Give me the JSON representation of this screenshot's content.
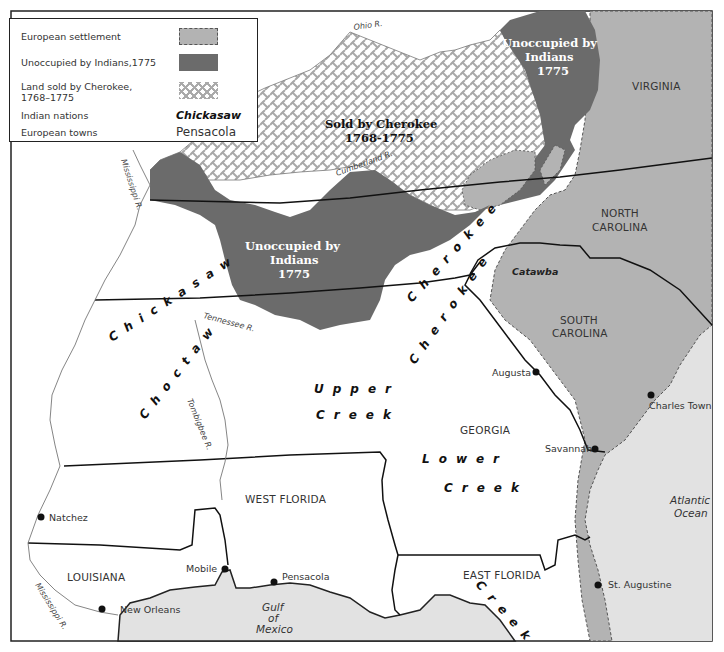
{
  "legend": {
    "items": [
      {
        "label": "European settlement",
        "swatch": "dashed-light-gray",
        "color": "#b3b3b3"
      },
      {
        "label": "Unoccupied by Indians,1775",
        "swatch": "solid-dark-gray",
        "color": "#6b6b6b"
      },
      {
        "label": "Land sold by Cherokee, 1768–1775",
        "label_line1": "Land sold by Cherokee,",
        "label_line2": "1768–1775",
        "swatch": "crosshatch",
        "color": "#aaaaaa"
      },
      {
        "label": "Indian nations",
        "sample": "Chickasaw"
      },
      {
        "label": "European towns",
        "sample": "Pensacola"
      }
    ]
  },
  "colors": {
    "european_settlement": "#b3b3b3",
    "unoccupied": "#6b6b6b",
    "sold_hatch": "#aaaaaa",
    "water": "#e2e2e2",
    "land": "#ffffff",
    "border": "#222222"
  },
  "regions": {
    "sold_by_cherokee": {
      "line1": "Sold by Cherokee",
      "line2": "1768-1775"
    },
    "unoccupied_north": {
      "line1": "Unoccupied by",
      "line2": "Indians",
      "line3": "1775"
    },
    "unoccupied_central": {
      "line1": "Unoccupied by",
      "line2": "Indians",
      "line3": "1775"
    }
  },
  "colonies": {
    "virginia": "VIRGINIA",
    "north_carolina_1": "NORTH",
    "north_carolina_2": "CAROLINA",
    "south_carolina_1": "SOUTH",
    "south_carolina_2": "CAROLINA",
    "georgia": "GEORGIA",
    "west_florida": "WEST FLORIDA",
    "east_florida": "EAST FLORIDA",
    "louisiana": "LOUISIANA"
  },
  "nations": {
    "chickasaw": "Chickasaw",
    "choctaw": "Choctaw",
    "cherokee_1": "Cherokee",
    "cherokee_2": "Cherokee",
    "catawba": "Catawba",
    "upper_creek_1": "Upper",
    "upper_creek_2": "Creek",
    "lower_creek_1": "Lower",
    "lower_creek_2": "Creek",
    "creek_florida": "Creek"
  },
  "towns": [
    {
      "name": "Augusta",
      "x": 536,
      "y": 372
    },
    {
      "name": "Charles Town",
      "x": 651,
      "y": 395
    },
    {
      "name": "Savannah",
      "x": 595,
      "y": 449
    },
    {
      "name": "St. Augustine",
      "x": 598,
      "y": 585
    },
    {
      "name": "Natchez",
      "x": 41,
      "y": 517
    },
    {
      "name": "Mobile",
      "x": 225,
      "y": 569
    },
    {
      "name": "Pensacola",
      "x": 274,
      "y": 582
    },
    {
      "name": "New Orleans",
      "x": 102,
      "y": 609
    }
  ],
  "rivers": {
    "ohio": "Ohio R.",
    "cumberland": "Cumberland R.",
    "tennessee": "Tennessee R.",
    "mississippi_north": "Mississippi R.",
    "mississippi_south": "Mississippi R.",
    "tombigbee": "Tombigbee R."
  },
  "water": {
    "gulf_1": "Gulf",
    "gulf_2": "of",
    "gulf_3": "Mexico",
    "atlantic_1": "Atlantic",
    "atlantic_2": "Ocean"
  }
}
